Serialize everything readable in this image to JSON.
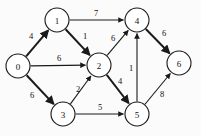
{
  "diagram": {
    "type": "directed-weighted-graph",
    "canvas": {
      "width": 201,
      "height": 136,
      "background": "#fbfbfb"
    },
    "colors": {
      "stroke": "#1a1a1a",
      "node_fill": "#ffffff",
      "label": "#111111"
    },
    "node_radius": 12,
    "nodes": [
      {
        "id": "0",
        "label": "0",
        "x": 18,
        "y": 66
      },
      {
        "id": "1",
        "label": "1",
        "x": 57,
        "y": 20
      },
      {
        "id": "2",
        "label": "2",
        "x": 99,
        "y": 65
      },
      {
        "id": "3",
        "label": "3",
        "x": 63,
        "y": 114
      },
      {
        "id": "4",
        "label": "4",
        "x": 137,
        "y": 20
      },
      {
        "id": "5",
        "label": "5",
        "x": 137,
        "y": 114
      },
      {
        "id": "6",
        "label": "6",
        "x": 179,
        "y": 63
      }
    ],
    "edges": [
      {
        "from": "0",
        "to": "1",
        "weight": "4",
        "lx": 31,
        "ly": 36,
        "thick": 2.0
      },
      {
        "from": "0",
        "to": "2",
        "weight": "6",
        "lx": 59,
        "ly": 58,
        "thick": 1.1
      },
      {
        "from": "0",
        "to": "3",
        "weight": "6",
        "lx": 32,
        "ly": 95,
        "thick": 2.0
      },
      {
        "from": "1",
        "to": "2",
        "weight": "1",
        "lx": 85,
        "ly": 36,
        "thick": 2.0
      },
      {
        "from": "1",
        "to": "4",
        "weight": "7",
        "lx": 96,
        "ly": 13,
        "thick": 1.1
      },
      {
        "from": "2",
        "to": "4",
        "weight": "6",
        "lx": 113,
        "ly": 38,
        "thick": 1.1
      },
      {
        "from": "2",
        "to": "5",
        "weight": "4",
        "lx": 120,
        "ly": 81,
        "thick": 2.0
      },
      {
        "from": "3",
        "to": "2",
        "weight": "2",
        "lx": 78,
        "ly": 89,
        "thick": 1.1
      },
      {
        "from": "3",
        "to": "5",
        "weight": "5",
        "lx": 100,
        "ly": 107,
        "thick": 1.1
      },
      {
        "from": "4",
        "to": "6",
        "weight": "6",
        "lx": 164,
        "ly": 33,
        "thick": 2.0
      },
      {
        "from": "5",
        "to": "4",
        "weight": "1",
        "lx": 131,
        "ly": 68,
        "thick": 1.1
      },
      {
        "from": "5",
        "to": "6",
        "weight": "8",
        "lx": 162,
        "ly": 94,
        "thick": 1.1
      }
    ]
  }
}
